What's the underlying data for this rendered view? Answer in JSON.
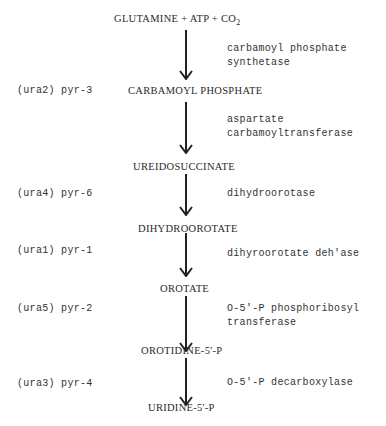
{
  "diagram": {
    "start": {
      "part1": "GLUTAMINE + ATP + CO",
      "subscript": "2"
    },
    "steps": [
      {
        "gene": "",
        "enzyme_lines": [
          "carbamoyl phosphate",
          "synthetase"
        ],
        "product": "CARBAMOYL PHOSPHATE",
        "product_gene": "(ura2) pyr-3"
      },
      {
        "gene": "",
        "enzyme_lines": [
          "aspartate",
          "carbamoyltransferase"
        ],
        "product": "UREIDOSUCCINATE"
      },
      {
        "gene": "(ura4) pyr-6",
        "enzyme_lines": [
          "dihydroorotase"
        ],
        "product": "DIHYDROOROTATE"
      },
      {
        "gene": "(ura1) pyr-1",
        "enzyme_lines": [
          "dihyroorotate deh'ase"
        ],
        "product": "OROTATE"
      },
      {
        "gene": "(ura5) pyr-2",
        "enzyme_lines": [
          "O-5'-P phosphoribosyl",
          "transferase"
        ],
        "product": "OROTIDINE-5'-P"
      },
      {
        "gene": "(ura3) pyr-4",
        "enzyme_lines": [
          "O-5'-P decarboxylase"
        ],
        "product": "URIDINE-5'-P"
      }
    ],
    "colors": {
      "ink": "#2a2a2a",
      "background": "#ffffff"
    }
  }
}
